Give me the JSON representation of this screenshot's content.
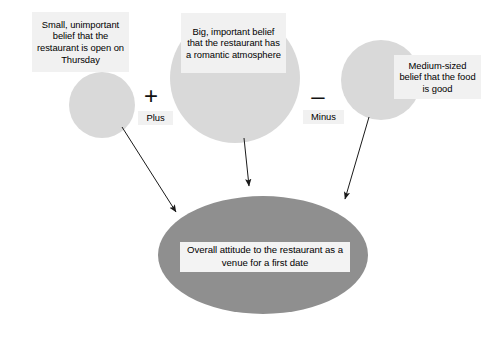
{
  "diagram": {
    "background_color": "#ffffff",
    "belief_circle_color": "#d9d9d9",
    "outcome_ellipse_color": "#8f8f8f",
    "label_background_color": "#f1f1f1",
    "text_color": "#000000",
    "arrow_color": "#1a1a1a"
  },
  "beliefs": [
    {
      "id": "belief-small",
      "label": "Small, unimportant belief that the restaurant is open on Thursday",
      "size": "small",
      "shape": "circle"
    },
    {
      "id": "belief-big",
      "label": "Big, important belief that the restaurant has a romantic atmosphere",
      "size": "big",
      "shape": "circle"
    },
    {
      "id": "belief-medium",
      "label": "Medium-sized belief that the food is good",
      "size": "medium",
      "shape": "circle"
    }
  ],
  "operators": [
    {
      "id": "plus",
      "symbol": "+",
      "word": "Plus"
    },
    {
      "id": "minus",
      "symbol": "–",
      "word": "Minus"
    }
  ],
  "outcome": {
    "id": "overall-attitude",
    "label": "Overall attitude to the restaurant as a venue for a first date",
    "shape": "ellipse"
  }
}
